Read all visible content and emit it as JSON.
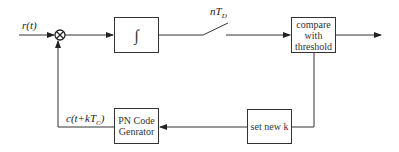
{
  "diagram": {
    "input_label": "r(t)",
    "integrator_symbol": "∫",
    "switch_label_n": "nT",
    "switch_label_sub": "D",
    "compare_block": [
      "compare",
      "with",
      "threshold"
    ],
    "set_block": "set new k",
    "pn_block": [
      "PN Code",
      "Genrator"
    ],
    "feedback_label_main": "c(t+kT",
    "feedback_label_sub": "C",
    "feedback_label_close": ")",
    "line_color": "#333333"
  }
}
